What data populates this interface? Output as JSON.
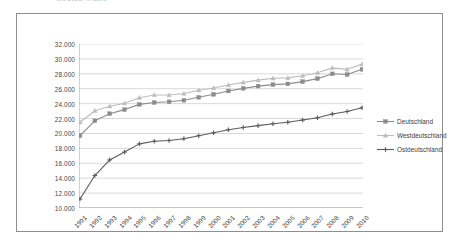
{
  "caption": {
    "text": "bis 2010, in Euro"
  },
  "chart_data": {
    "type": "line",
    "title": "",
    "subtitle": "",
    "xlabel": "",
    "ylabel": "",
    "grid": true,
    "legend_position": "right",
    "ylim": [
      10000,
      32000
    ],
    "ytick_step": 2000,
    "ytick_labels": [
      "32.000",
      "30.000",
      "28.000",
      "26.000",
      "24.000",
      "22.000",
      "20.000",
      "18.000",
      "16.000",
      "14.000",
      "12.000",
      "10.000"
    ],
    "ytick_values": [
      32000,
      30000,
      28000,
      26000,
      24000,
      22000,
      20000,
      18000,
      16000,
      14000,
      12000,
      10000
    ],
    "categories": [
      "1991",
      "1992",
      "1993",
      "1994",
      "1995",
      "1996",
      "1997",
      "1998",
      "1999",
      "2000",
      "2001",
      "2002",
      "2003",
      "2004",
      "2005",
      "2006",
      "2007",
      "2008",
      "2009",
      "2010"
    ],
    "series": [
      {
        "name": "Deutschland",
        "color": "#8c8c8c",
        "marker": "square",
        "values": [
          19700,
          21700,
          22650,
          23200,
          23900,
          24150,
          24250,
          24450,
          24850,
          25250,
          25700,
          26050,
          26350,
          26550,
          26650,
          26950,
          27350,
          28000,
          27900,
          28600
        ]
      },
      {
        "name": "Westdeutschland",
        "color": "#bdbdbd",
        "marker": "triangle",
        "values": [
          21500,
          23050,
          23650,
          24050,
          24800,
          25150,
          25150,
          25350,
          25800,
          26100,
          26500,
          26850,
          27150,
          27400,
          27450,
          27750,
          28150,
          28800,
          28600,
          29300
        ]
      },
      {
        "name": "Ostdeutschland",
        "color": "#5b5b5b",
        "marker": "cross",
        "values": [
          11200,
          14350,
          16450,
          17500,
          18600,
          18950,
          19050,
          19300,
          19700,
          20100,
          20500,
          20800,
          21050,
          21300,
          21500,
          21800,
          22100,
          22600,
          22950,
          23450
        ]
      }
    ]
  },
  "legend": {
    "items": [
      {
        "label": "Deutschland"
      },
      {
        "label": "Westdeutschland"
      },
      {
        "label": "Ostdeutschland"
      }
    ]
  }
}
